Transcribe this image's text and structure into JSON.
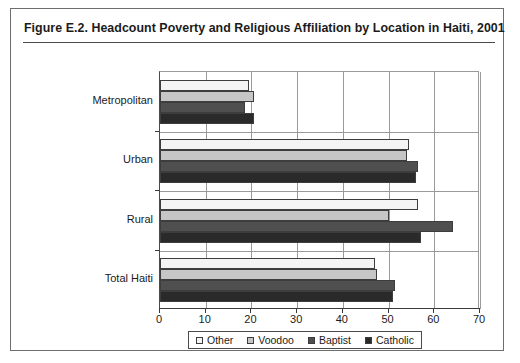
{
  "figure": {
    "title": "Figure E.2.  Headcount Poverty and Religious Affiliation by Location in Haiti, 2001"
  },
  "legend": {
    "items": [
      {
        "label": "Other",
        "color": "#f4f4f4"
      },
      {
        "label": "Voodoo",
        "color": "#c6c6c6"
      },
      {
        "label": "Baptist",
        "color": "#4f4f4f"
      },
      {
        "label": "Catholic",
        "color": "#2a2a2a"
      }
    ]
  },
  "chart_data": {
    "type": "bar",
    "orientation": "horizontal",
    "title": "Figure E.2.  Headcount Poverty and Religious Affiliation by Location in Haiti, 2001",
    "xlabel": "",
    "ylabel": "",
    "xlim": [
      0,
      70
    ],
    "xticks": [
      0,
      10,
      20,
      30,
      40,
      50,
      60,
      70
    ],
    "grid": true,
    "legend_position": "bottom",
    "categories": [
      "Metropolitan",
      "Urban",
      "Rural",
      "Total Haiti"
    ],
    "series": [
      {
        "name": "Other",
        "color": "#f4f4f4",
        "values": [
          19.5,
          54.5,
          56.5,
          47.0
        ]
      },
      {
        "name": "Voodoo",
        "color": "#c6c6c6",
        "values": [
          20.5,
          54.0,
          50.0,
          47.5
        ]
      },
      {
        "name": "Baptist",
        "color": "#4f4f4f",
        "values": [
          18.5,
          56.5,
          64.0,
          51.5
        ]
      },
      {
        "name": "Catholic",
        "color": "#2a2a2a",
        "values": [
          20.5,
          56.0,
          57.0,
          51.0
        ]
      }
    ]
  }
}
